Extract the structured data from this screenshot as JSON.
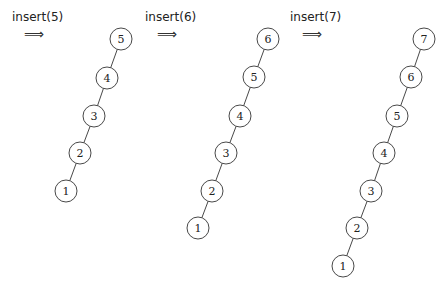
{
  "diagram": {
    "steps": [
      {
        "label": "insert(5)",
        "arrow": "⟹",
        "label_pos": [
          12,
          10
        ],
        "arrow_pos": [
          24,
          27
        ],
        "nodes": [
          {
            "key": "5",
            "x": 121,
            "y": 39
          },
          {
            "key": "4",
            "x": 107,
            "y": 78
          },
          {
            "key": "3",
            "x": 94,
            "y": 116
          },
          {
            "key": "2",
            "x": 80,
            "y": 153
          },
          {
            "key": "1",
            "x": 66,
            "y": 191
          }
        ]
      },
      {
        "label": "insert(6)",
        "arrow": "⟹",
        "label_pos": [
          145,
          10
        ],
        "arrow_pos": [
          157,
          27
        ],
        "nodes": [
          {
            "key": "6",
            "x": 268,
            "y": 39
          },
          {
            "key": "5",
            "x": 254,
            "y": 77
          },
          {
            "key": "4",
            "x": 240,
            "y": 116
          },
          {
            "key": "3",
            "x": 226,
            "y": 153
          },
          {
            "key": "2",
            "x": 212,
            "y": 191
          },
          {
            "key": "1",
            "x": 198,
            "y": 228
          }
        ]
      },
      {
        "label": "insert(7)",
        "arrow": "⟹",
        "label_pos": [
          290,
          10
        ],
        "arrow_pos": [
          302,
          27
        ],
        "nodes": [
          {
            "key": "7",
            "x": 424,
            "y": 39
          },
          {
            "key": "6",
            "x": 411,
            "y": 77
          },
          {
            "key": "5",
            "x": 397,
            "y": 116
          },
          {
            "key": "4",
            "x": 384,
            "y": 153
          },
          {
            "key": "3",
            "x": 371,
            "y": 191
          },
          {
            "key": "2",
            "x": 357,
            "y": 228
          },
          {
            "key": "1",
            "x": 343,
            "y": 266
          }
        ]
      }
    ],
    "node_radius": 11,
    "stroke_color": "#333333"
  }
}
